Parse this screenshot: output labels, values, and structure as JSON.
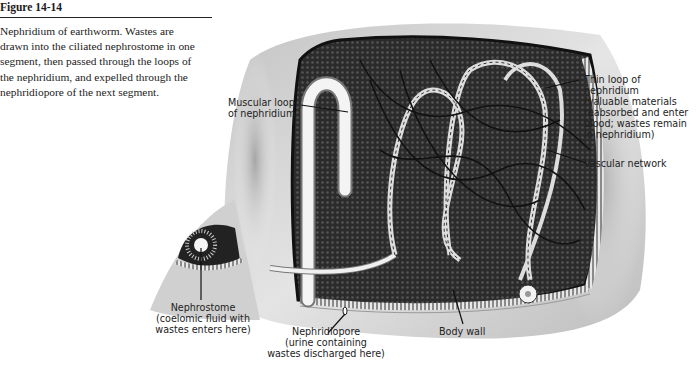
{
  "caption": {
    "figure_number": "Figure 14-14",
    "lines": [
      "Nephridium of earthworm. Wastes are",
      "drawn into the ciliated nephrostome in one",
      "segment, then passed through the loops of",
      "the nephridium, and expelled through the",
      "nephridiopore of the next segment."
    ]
  },
  "labels": {
    "muscular_loop": [
      "Muscular loop",
      "of nephridium"
    ],
    "thin_loop": [
      "Thin loop of",
      "nephridium",
      "(valuable materials",
      "reabsorbed and enter",
      "blood; wastes remain",
      "in nephridium)"
    ],
    "vascular_network": [
      "Vascular network"
    ],
    "nephrostome": [
      "Nephrostome",
      "(coelomic fluid with",
      "wastes enters here)"
    ],
    "nephridiopore": [
      "Nephridiopore",
      "(urine containing",
      "wastes discharged here)"
    ],
    "body_wall": [
      "Body wall"
    ]
  },
  "colors": {
    "tissue_dark": "#2e2e2e",
    "body_light": "#d9d9d9",
    "tubule": "#f2f2f2",
    "leader": "#111111"
  }
}
